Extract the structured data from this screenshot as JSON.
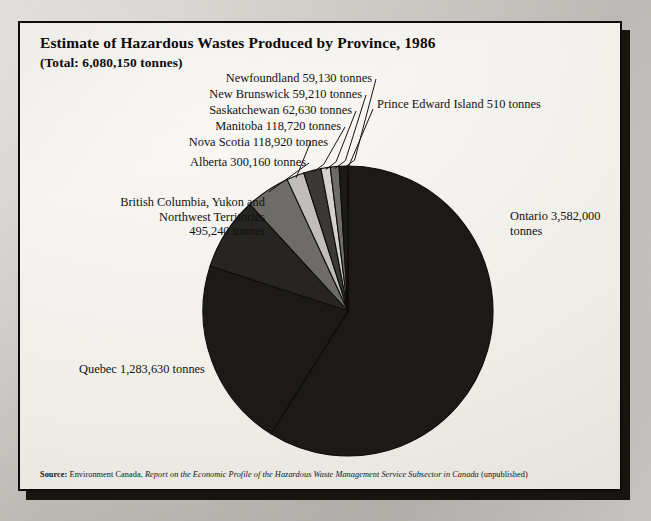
{
  "figure": {
    "title": "Estimate of Hazardous Wastes Produced by Province, 1986",
    "subtitle": "(Total: 6,080,150 tonnes)",
    "source_prefix": "Source:",
    "source_agency": "Environment Canada,",
    "source_title": "Report on the Economic Profile of the Hazardous Waste Management Service Subsector in Canada",
    "source_note": "(unpublished)"
  },
  "labels": {
    "newfoundland": "Newfoundland 59,130 tonnes",
    "new_brunswick": "New Brunswick 59,210 tonnes",
    "saskatchewan": "Saskatchewan 62,630 tonnes",
    "manitoba": "Manitoba 118,720 tonnes",
    "nova_scotia": "Nova Scotia 118,920 tonnes",
    "alberta": "Alberta 300,160 tonnes",
    "bc_line1": "British Columbia, Yukon and",
    "bc_line2": "Northwest Territories",
    "bc_line3": "495,240 tonnes",
    "pei": "Prince Edward Island 510 tonnes",
    "ontario_line1": "Ontario 3,582,000",
    "ontario_line2": "tonnes",
    "quebec": "Quebec 1,283,630 tonnes"
  },
  "chart_data": {
    "type": "pie",
    "title": "Estimate of Hazardous Wastes Produced by Province, 1986",
    "subtitle": "(Total: 6,080,150 tonnes)",
    "unit": "tonnes",
    "total": 6080150,
    "start_angle_deg": 0,
    "direction": "clockwise",
    "legend": "none (direct callout labels with leader lines)",
    "categories": [
      "Ontario",
      "Quebec",
      "British Columbia, Yukon and Northwest Territories",
      "Alberta",
      "Nova Scotia",
      "Manitoba",
      "Saskatchewan",
      "New Brunswick",
      "Newfoundland",
      "Prince Edward Island"
    ],
    "values": [
      3582000,
      1283630,
      495240,
      300160,
      118920,
      118720,
      62630,
      59210,
      59130,
      510
    ],
    "slices": [
      {
        "label": "Ontario",
        "value": 3582000,
        "percent": 58.91,
        "color": "#1b1a18"
      },
      {
        "label": "Quebec",
        "value": 1283630,
        "percent": 21.11,
        "color": "#1b1a18"
      },
      {
        "label": "British Columbia, Yukon and Northwest Territories",
        "value": 495240,
        "percent": 8.15,
        "color": "#262523"
      },
      {
        "label": "Alberta",
        "value": 300160,
        "percent": 4.94,
        "color": "#6d6c69"
      },
      {
        "label": "Nova Scotia",
        "value": 118920,
        "percent": 1.96,
        "color": "#bfbeba"
      },
      {
        "label": "Manitoba",
        "value": 118720,
        "percent": 1.95,
        "color": "#3a3937"
      },
      {
        "label": "Saskatchewan",
        "value": 62630,
        "percent": 1.03,
        "color": "#d3d2ce"
      },
      {
        "label": "New Brunswick",
        "value": 59210,
        "percent": 0.97,
        "color": "#6d6c69"
      },
      {
        "label": "Newfoundland",
        "value": 59130,
        "percent": 0.97,
        "color": "#1b1a18"
      },
      {
        "label": "Prince Edward Island",
        "value": 510,
        "percent": 0.01,
        "color": "#8b8a87"
      }
    ],
    "colors": {
      "dark": "#1b1a18",
      "mid_dark": "#3a3937",
      "mid": "#6d6c69",
      "light": "#bfbeba",
      "lightest": "#d3d2ce",
      "outline": "#0d0c0a",
      "plate_background": "#f4f2ed"
    }
  }
}
